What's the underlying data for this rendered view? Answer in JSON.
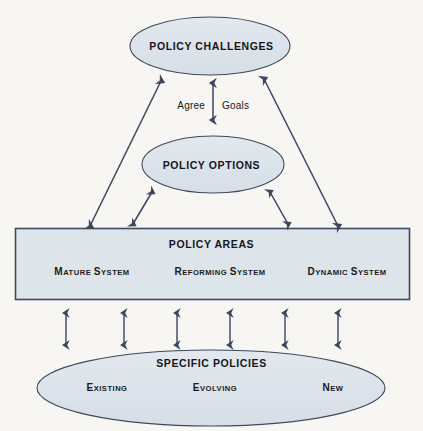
{
  "diagram": {
    "background_color": "#f7f6f2",
    "shape_fill": "#dce4ea",
    "shape_stroke": "#3c4a60",
    "arrow_color": "#3b4660",
    "nodes": {
      "policy_challenges": {
        "label": "POLICY CHALLENGES",
        "shape": "ellipse"
      },
      "policy_options": {
        "label": "POLICY OPTIONS",
        "shape": "ellipse"
      },
      "policy_areas": {
        "label": "POLICY AREAS",
        "shape": "rectangle",
        "items": [
          {
            "cap": "M",
            "rest": "ATURE ",
            "cap2": "S",
            "rest2": "YSTEM",
            "full": "Mature System"
          },
          {
            "cap": "R",
            "rest": "EFORMING ",
            "cap2": "S",
            "rest2": "YSTEM",
            "full": "Reforming System"
          },
          {
            "cap": "D",
            "rest": "YNAMIC ",
            "cap2": "S",
            "rest2": "YSTEM",
            "full": "Dynamic System"
          }
        ]
      },
      "specific_policies": {
        "label": "SPECIFIC POLICIES",
        "shape": "ellipse",
        "items": [
          {
            "cap": "E",
            "rest": "XISTING",
            "full": "Existing"
          },
          {
            "cap": "E",
            "rest": "VOLVING",
            "full": "Evolving"
          },
          {
            "cap": "N",
            "rest": "EW",
            "full": "New"
          }
        ]
      }
    },
    "connector_labels": {
      "agree": "Agree",
      "goals": "Goals"
    },
    "connectors": [
      {
        "name": "agree-goals-vertical-arrow",
        "style": "double-headed"
      },
      {
        "name": "challenges-to-options-arrow",
        "style": "double-headed"
      },
      {
        "name": "left-diagonal-areas-to-challenges",
        "style": "double-headed"
      },
      {
        "name": "right-diagonal-areas-to-challenges",
        "style": "double-headed"
      },
      {
        "name": "left-diagonal-areas-to-options",
        "style": "double-headed"
      },
      {
        "name": "right-diagonal-areas-to-options",
        "style": "double-headed"
      },
      {
        "name": "areas-to-policies-arrow-1",
        "style": "double-headed"
      },
      {
        "name": "areas-to-policies-arrow-2",
        "style": "double-headed"
      },
      {
        "name": "areas-to-policies-arrow-3",
        "style": "double-headed"
      },
      {
        "name": "areas-to-policies-arrow-4",
        "style": "double-headed"
      },
      {
        "name": "areas-to-policies-arrow-5",
        "style": "double-headed"
      },
      {
        "name": "areas-to-policies-arrow-6",
        "style": "double-headed"
      }
    ]
  }
}
